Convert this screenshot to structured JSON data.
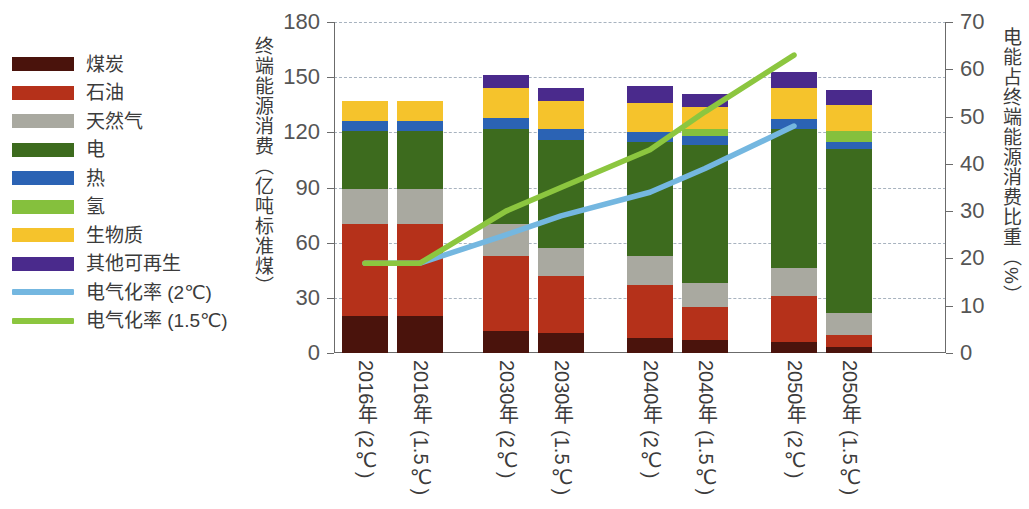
{
  "chart_data": {
    "type": "bar",
    "title": "",
    "subtitle": "",
    "xlabel": "",
    "ylabel": "终端能源消费（亿吨标准煤）",
    "y2label": "电能占终端能源消费比重（%）",
    "ylim": [
      0,
      180
    ],
    "y2lim": [
      0,
      70
    ],
    "yticks": [
      0,
      30,
      60,
      90,
      120,
      150,
      180
    ],
    "y2ticks": [
      0,
      10,
      20,
      30,
      40,
      50,
      60,
      70
    ],
    "grid": true,
    "legend_position": "left-outside",
    "categories": [
      "2016年 (2℃)",
      "2016年 (1.5℃)",
      "2030年 (2℃)",
      "2030年 (1.5℃)",
      "2040年 (2℃)",
      "2040年 (1.5℃)",
      "2050年 (2℃)",
      "2050年 (1.5℃)"
    ],
    "stack_order": [
      "煤炭",
      "石油",
      "天然气",
      "电",
      "热",
      "氢",
      "生物质",
      "其他可再生"
    ],
    "series": [
      {
        "name": "煤炭",
        "color": "#4a130c",
        "values": [
          20,
          20,
          12,
          11,
          8,
          7,
          6,
          3
        ]
      },
      {
        "name": "石油",
        "color": "#b5311a",
        "values": [
          50,
          50,
          41,
          31,
          29,
          18,
          25,
          7
        ]
      },
      {
        "name": "天然气",
        "color": "#a9a9a0",
        "values": [
          19,
          19,
          17,
          15,
          16,
          13,
          15,
          12
        ]
      },
      {
        "name": "电",
        "color": "#3d6b1e",
        "values": [
          32,
          32,
          52,
          59,
          62,
          75,
          76,
          89
        ]
      },
      {
        "name": "热",
        "color": "#2b63b4",
        "values": [
          5,
          5,
          6,
          6,
          5,
          5,
          5,
          4
        ]
      },
      {
        "name": "氢",
        "color": "#85c03d",
        "values": [
          0,
          0,
          0,
          0,
          0,
          4,
          0,
          6
        ]
      },
      {
        "name": "生物质",
        "color": "#f5c32c",
        "values": [
          11,
          11,
          16,
          15,
          16,
          12,
          17,
          14
        ]
      },
      {
        "name": "其他可再生",
        "color": "#4a2a8c",
        "values": [
          0,
          0,
          7,
          7,
          9,
          7,
          9,
          8
        ]
      }
    ],
    "totals": [
      137,
      137,
      151,
      144,
      145,
      141,
      153,
      143
    ],
    "lines": [
      {
        "name": "电气化率 (2℃)",
        "color": "#74b7e0",
        "axis": "right",
        "unit": "%",
        "x": [
          "2016年 (2℃)",
          "2016年 (1.5℃)",
          "2030年 (2℃)",
          "2030年 (1.5℃)",
          "2040年 (2℃)",
          "2040年 (1.5℃)",
          "2050年 (2℃)"
        ],
        "values": [
          19,
          19,
          25,
          29,
          34,
          39,
          48
        ]
      },
      {
        "name": "电气化率 (1.5℃)",
        "color": "#8cc63f",
        "axis": "right",
        "unit": "%",
        "x": [
          "2016年 (2℃)",
          "2016年 (1.5℃)",
          "2030年 (2℃)",
          "2030年 (1.5℃)",
          "2040年 (2℃)",
          "2040年 (1.5℃)",
          "2050年 (2℃)"
        ],
        "values": [
          19,
          19,
          30,
          35,
          43,
          51,
          63
        ]
      }
    ]
  },
  "legend": {
    "items": [
      {
        "label": "煤炭",
        "color": "#4a130c",
        "type": "box"
      },
      {
        "label": "石油",
        "color": "#b5311a",
        "type": "box"
      },
      {
        "label": "天然气",
        "color": "#a9a9a0",
        "type": "box"
      },
      {
        "label": "电",
        "color": "#3d6b1e",
        "type": "box"
      },
      {
        "label": "热",
        "color": "#2b63b4",
        "type": "box"
      },
      {
        "label": "氢",
        "color": "#85c03d",
        "type": "box"
      },
      {
        "label": "生物质",
        "color": "#f5c32c",
        "type": "box"
      },
      {
        "label": "其他可再生",
        "color": "#4a2a8c",
        "type": "box"
      },
      {
        "label": "电气化率 (2℃)",
        "color": "#74b7e0",
        "type": "line"
      },
      {
        "label": "电气化率 (1.5℃)",
        "color": "#8cc63f",
        "type": "line"
      }
    ]
  }
}
